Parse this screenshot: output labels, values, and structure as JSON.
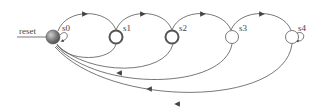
{
  "diagram": {
    "type": "state-machine",
    "input_label": "reset",
    "states": [
      {
        "id": "s0",
        "label": "s0",
        "kind": "initial"
      },
      {
        "id": "s1",
        "label": "s1",
        "kind": "accepting"
      },
      {
        "id": "s2",
        "label": "s2",
        "kind": "accepting"
      },
      {
        "id": "s3",
        "label": "s3",
        "kind": "normal"
      },
      {
        "id": "s4",
        "label": "s4",
        "kind": "normal"
      }
    ],
    "transitions": [
      {
        "from": "s0",
        "to": "s0",
        "kind": "self-loop"
      },
      {
        "from": "s0",
        "to": "s1"
      },
      {
        "from": "s1",
        "to": "s0"
      },
      {
        "from": "s1",
        "to": "s2"
      },
      {
        "from": "s2",
        "to": "s0"
      },
      {
        "from": "s2",
        "to": "s3"
      },
      {
        "from": "s3",
        "to": "s0"
      },
      {
        "from": "s3",
        "to": "s4"
      },
      {
        "from": "s4",
        "to": "s0"
      },
      {
        "from": "s4",
        "to": "s4",
        "kind": "self-loop"
      }
    ],
    "colors": {
      "stroke": "#555555",
      "initial_fill": "#777777",
      "background": "#ffffff"
    }
  }
}
